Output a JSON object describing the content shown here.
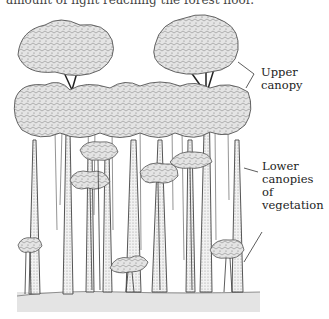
{
  "figure": {
    "top_text": "amount of light reaching the forest floor.",
    "labels": {
      "upper": [
        "Upper",
        "canopy"
      ],
      "lower": [
        "Lower",
        "canopies",
        "of",
        "vegetation"
      ]
    },
    "colors": {
      "foliage": "#e2e2e2",
      "foliage_stroke": "#555555",
      "trunk": "#eeeeee",
      "ground": "#e4e4e4",
      "ink": "#333333"
    }
  }
}
